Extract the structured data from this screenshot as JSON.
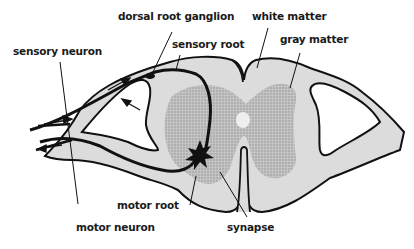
{
  "diagram": {
    "type": "anatomical-cross-section",
    "colors": {
      "white_matter": "#dcdcdc",
      "gray_matter": "#b4b4b4",
      "outline": "#111111",
      "neuron_path": "#111111",
      "background": "#ffffff"
    },
    "labels": {
      "dorsal_root_ganglion": "dorsal root ganglion",
      "white_matter": "white matter",
      "gray_matter": "gray matter",
      "sensory_neuron": "sensory neuron",
      "sensory_root": "sensory root",
      "motor_root": "motor root",
      "motor_neuron": "motor neuron",
      "synapse": "synapse"
    }
  }
}
